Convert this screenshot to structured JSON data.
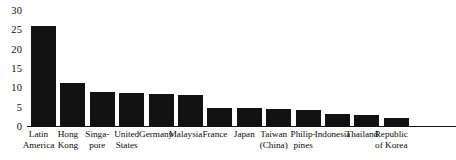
{
  "chart_data": {
    "type": "bar",
    "title": "",
    "subtitle": "",
    "xlabel": "",
    "ylabel": "",
    "ylim": [
      0,
      30
    ],
    "yticks": [
      0,
      5,
      10,
      15,
      20,
      25,
      30
    ],
    "ytick_labels": [
      "0",
      "5",
      "10",
      "15",
      "20",
      "25",
      "30"
    ],
    "grid": false,
    "legend": null,
    "bar_color": "#121212",
    "categories": [
      "Latin\nAmerica",
      "Hong\nKong",
      "Singa-\npore",
      "United\nStates",
      "Germany",
      "Malaysia",
      "France",
      "Japan",
      "Taiwan\n(China)",
      "Philip-\npines",
      "Indonesia",
      "Thailand",
      "Republic\nof Korea"
    ],
    "values": [
      26,
      11.4,
      9.1,
      8.8,
      8.5,
      8.2,
      5,
      4.8,
      4.6,
      4.3,
      3.4,
      3.1,
      2.3
    ]
  }
}
